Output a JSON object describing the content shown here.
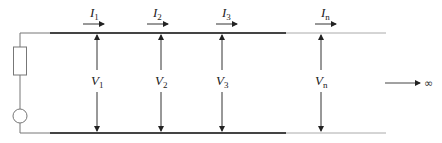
{
  "diagram": {
    "colors": {
      "line": "#333333",
      "thin_line": "#9a9a9a",
      "background": "#ffffff"
    },
    "source": {
      "components": [
        "resistor",
        "voltage-source"
      ]
    },
    "sections": [
      {
        "current": {
          "sym": "I",
          "sub": "1"
        },
        "voltage": {
          "sym": "V",
          "sub": "1"
        }
      },
      {
        "current": {
          "sym": "I",
          "sub": "2"
        },
        "voltage": {
          "sym": "V",
          "sub": "2"
        }
      },
      {
        "current": {
          "sym": "I",
          "sub": "3"
        },
        "voltage": {
          "sym": "V",
          "sub": "3"
        }
      },
      {
        "current": {
          "sym": "I",
          "sub": "n"
        },
        "voltage": {
          "sym": "V",
          "sub": "n"
        }
      }
    ],
    "infinity_label": "∞"
  }
}
